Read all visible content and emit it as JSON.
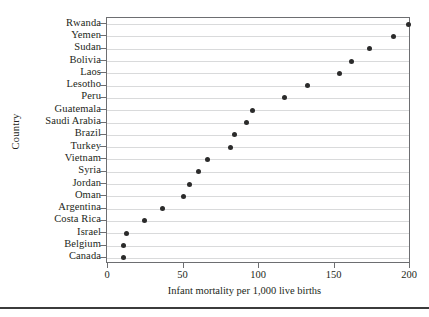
{
  "chart_data": {
    "type": "scatter",
    "title": "",
    "xlabel": "Infant mortality per 1,000 live births",
    "ylabel": "Country",
    "xlim": [
      0,
      200
    ],
    "ylim_categories_top_to_bottom": true,
    "grid": "horizontal",
    "legend": "none",
    "xticks": [
      0,
      50,
      100,
      150,
      200
    ],
    "xtick_labels": [
      "0",
      "50",
      "100",
      "150",
      "200"
    ],
    "categories": [
      "Rwanda",
      "Yemen",
      "Sudan",
      "Bolivia",
      "Laos",
      "Lesotho",
      "Peru",
      "Guatemala",
      "Saudi Arabia",
      "Brazil",
      "Turkey",
      "Vietnam",
      "Syria",
      "Jordan",
      "Oman",
      "Argentina",
      "Costa Rica",
      "Israel",
      "Belgium",
      "Canada"
    ],
    "values": [
      199,
      189,
      173,
      161,
      153,
      132,
      117,
      96,
      92,
      84,
      81,
      66,
      60,
      54,
      50,
      36,
      24,
      12,
      10,
      10
    ],
    "marker": "filled-circle",
    "marker_color": "#2b2b2b"
  },
  "figure": {
    "ylabel": "Country",
    "xlabel": "Infant mortality per 1,000 live births"
  }
}
